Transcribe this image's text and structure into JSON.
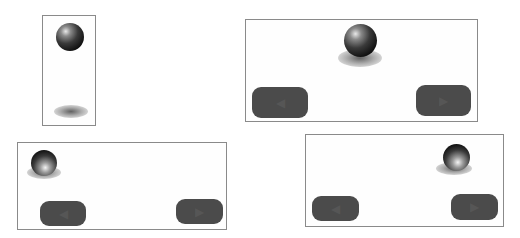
{
  "colors": {
    "panel_border": "#8a8a8a",
    "button_fill": "#4b4b4b",
    "ball": "#111111"
  },
  "panels": [
    {
      "name": "panel-1",
      "ball": {
        "state": "high",
        "shadow": "detached"
      }
    },
    {
      "name": "panel-2",
      "ball": {
        "state": "centered"
      },
      "buttons": {
        "left": {
          "icon": "left-arrow-icon",
          "glyph": "◀"
        },
        "right": {
          "icon": "right-arrow-icon",
          "glyph": "▶"
        }
      }
    },
    {
      "name": "panel-3",
      "ball": {
        "state": "left"
      },
      "buttons": {
        "left": {
          "icon": "left-arrow-icon",
          "glyph": "◀"
        },
        "right": {
          "icon": "right-arrow-icon",
          "glyph": "▶"
        }
      }
    },
    {
      "name": "panel-4",
      "ball": {
        "state": "right"
      },
      "buttons": {
        "left": {
          "icon": "left-arrow-icon",
          "glyph": "◀"
        },
        "right": {
          "icon": "right-arrow-icon",
          "glyph": "▶"
        }
      }
    }
  ]
}
